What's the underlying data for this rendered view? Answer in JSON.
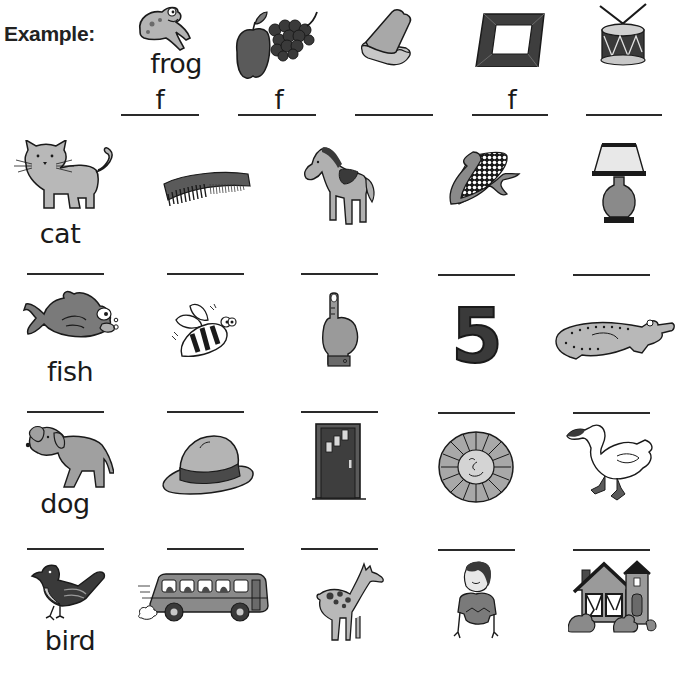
{
  "worksheet": {
    "example_label": "Example:",
    "rows": [
      {
        "row": "example",
        "items": [
          {
            "picture": "frog",
            "word": "frog",
            "answer": "f"
          },
          {
            "picture": "apple-and-grapes",
            "word": "",
            "answer": "f"
          },
          {
            "picture": "sandwich",
            "word": "",
            "answer": ""
          },
          {
            "picture": "picture-frame",
            "word": "",
            "answer": "f"
          },
          {
            "picture": "drum",
            "word": "",
            "answer": ""
          }
        ]
      },
      {
        "row": "c",
        "items": [
          {
            "picture": "cat",
            "word": "cat",
            "answer": ""
          },
          {
            "picture": "comb",
            "word": "",
            "answer": ""
          },
          {
            "picture": "horse",
            "word": "",
            "answer": ""
          },
          {
            "picture": "corn",
            "word": "",
            "answer": ""
          },
          {
            "picture": "lamp",
            "word": "",
            "answer": ""
          }
        ]
      },
      {
        "row": "f",
        "items": [
          {
            "picture": "fish",
            "word": "fish",
            "answer": ""
          },
          {
            "picture": "bee",
            "word": "",
            "answer": ""
          },
          {
            "picture": "finger",
            "word": "",
            "answer": ""
          },
          {
            "picture": "number-five",
            "word": "",
            "answer": ""
          },
          {
            "picture": "alligator",
            "word": "",
            "answer": ""
          }
        ]
      },
      {
        "row": "d",
        "items": [
          {
            "picture": "dog",
            "word": "dog",
            "answer": ""
          },
          {
            "picture": "hat",
            "word": "",
            "answer": ""
          },
          {
            "picture": "door",
            "word": "",
            "answer": ""
          },
          {
            "picture": "sun",
            "word": "",
            "answer": ""
          },
          {
            "picture": "duck",
            "word": "",
            "answer": ""
          }
        ]
      },
      {
        "row": "b",
        "items": [
          {
            "picture": "bird",
            "word": "bird",
            "answer": ""
          },
          {
            "picture": "bus",
            "word": "",
            "answer": ""
          },
          {
            "picture": "giraffe",
            "word": "",
            "answer": ""
          },
          {
            "picture": "boy",
            "word": "",
            "answer": ""
          },
          {
            "picture": "house",
            "word": "",
            "answer": ""
          }
        ]
      }
    ],
    "five_label": "5"
  },
  "colors": {
    "ink": "#1a1a1a",
    "mid_gray": "#9a9a9a",
    "dark_gray": "#4a4a4a",
    "light_gray": "#c8c8c8"
  }
}
